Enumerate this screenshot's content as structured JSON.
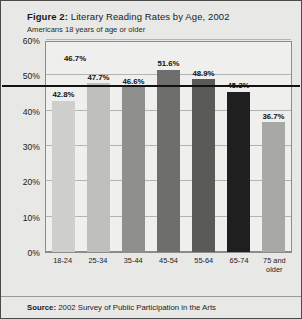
{
  "figure": {
    "label": "Figure 2:",
    "title": "Literary Reading Rates by Age, 2002",
    "subtitle": "Americans 18 years of age or older",
    "source_label": "Source:",
    "source_text": "2002 Survey of Public Participation in the Arts"
  },
  "chart_data": {
    "type": "bar",
    "title": "Literary Reading Rates by Age, 2002",
    "subtitle": "Americans 18 years of age or older",
    "xlabel": "",
    "ylabel": "",
    "ylim": [
      0,
      60
    ],
    "ytick_labels": [
      "60%",
      "50%",
      "40%",
      "30%",
      "20%",
      "10%",
      "0%"
    ],
    "ytick_values": [
      60,
      50,
      40,
      30,
      20,
      10,
      0
    ],
    "grid": true,
    "legend": "none",
    "categories": [
      "18-24",
      "25-34",
      "35-44",
      "45-54",
      "55-64",
      "65-74",
      "75 and older"
    ],
    "values": [
      42.8,
      47.7,
      46.6,
      51.6,
      48.9,
      45.3,
      36.7
    ],
    "value_labels": [
      "42.8%",
      "47.7%",
      "46.6%",
      "51.6%",
      "48.9%",
      "45.3%",
      "36.7%"
    ],
    "bar_colors": [
      "#cfcfcd",
      "#bfbfbd",
      "#8f8f8d",
      "#6e6e6c",
      "#5a5a58",
      "#1f1f1f",
      "#a8a8a6"
    ],
    "reference_line": {
      "value": 46.7,
      "label": "46.7%",
      "color": "#121212"
    },
    "source": "2002 Survey of Public Participation in the Arts"
  }
}
